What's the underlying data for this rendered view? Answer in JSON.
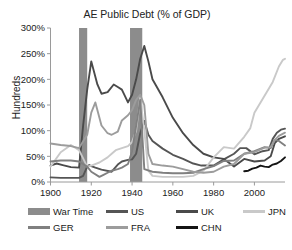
{
  "chart_data": {
    "type": "line",
    "title": "AE Public Debt (% of GDP)",
    "xlabel": "",
    "ylabel": "Hundreds",
    "xlim": [
      1900,
      2015
    ],
    "ylim": [
      0,
      300
    ],
    "ytick_labels": [
      "0%",
      "50%",
      "100%",
      "150%",
      "200%",
      "250%",
      "300%"
    ],
    "ytick_values": [
      0,
      50,
      100,
      150,
      200,
      250,
      300
    ],
    "xtick_labels": [
      "1900",
      "1920",
      "1940",
      "1960",
      "1980",
      "2000"
    ],
    "xtick_values": [
      1900,
      1920,
      1940,
      1960,
      1980,
      2000
    ],
    "grid": false,
    "legend_position": "bottom",
    "shaded_bands": [
      {
        "name": "War Time",
        "start": 1914,
        "end": 1918,
        "color": "#8c8c8c"
      },
      {
        "name": "War Time",
        "start": 1939,
        "end": 1945,
        "color": "#8c8c8c"
      }
    ],
    "series": [
      {
        "name": "US",
        "color": "#555555",
        "x": [
          1900,
          1905,
          1910,
          1914,
          1916,
          1918,
          1919,
          1920,
          1922,
          1925,
          1930,
          1933,
          1935,
          1938,
          1940,
          1942,
          1944,
          1946,
          1948,
          1950,
          1955,
          1960,
          1965,
          1970,
          1974,
          1980,
          1985,
          1990,
          1993,
          1996,
          2000,
          2004,
          2007,
          2009,
          2011,
          2013,
          2015
        ],
        "y": [
          9,
          8,
          8,
          8,
          12,
          30,
          33,
          31,
          28,
          24,
          20,
          34,
          40,
          43,
          44,
          55,
          95,
          119,
          92,
          80,
          65,
          53,
          45,
          36,
          32,
          32,
          44,
          55,
          66,
          66,
          54,
          60,
          62,
          84,
          96,
          102,
          104
        ]
      },
      {
        "name": "UK",
        "color": "#4a4a4a",
        "x": [
          1900,
          1903,
          1906,
          1910,
          1914,
          1916,
          1918,
          1920,
          1923,
          1925,
          1928,
          1931,
          1933,
          1935,
          1938,
          1940,
          1942,
          1944,
          1946,
          1948,
          1950,
          1955,
          1960,
          1965,
          1970,
          1975,
          1980,
          1985,
          1990,
          1995,
          2000,
          2005,
          2008,
          2010,
          2012,
          2015
        ],
        "y": [
          32,
          36,
          33,
          29,
          28,
          110,
          180,
          235,
          190,
          172,
          175,
          190,
          185,
          180,
          155,
          170,
          200,
          240,
          265,
          235,
          200,
          165,
          125,
          95,
          72,
          55,
          48,
          45,
          30,
          45,
          40,
          42,
          50,
          76,
          84,
          89
        ]
      },
      {
        "name": "JPN",
        "color": "#c9c9c9",
        "x": [
          1900,
          1905,
          1910,
          1914,
          1918,
          1920,
          1924,
          1928,
          1930,
          1932,
          1935,
          1938,
          1940,
          1942,
          1944,
          1946,
          1948,
          1950,
          1955,
          1960,
          1965,
          1970,
          1975,
          1980,
          1985,
          1990,
          1995,
          1998,
          2000,
          2003,
          2006,
          2009,
          2012,
          2014,
          2015
        ],
        "y": [
          30,
          58,
          72,
          62,
          30,
          32,
          38,
          48,
          55,
          62,
          66,
          70,
          78,
          100,
          165,
          100,
          22,
          12,
          10,
          10,
          10,
          12,
          22,
          48,
          68,
          65,
          88,
          105,
          135,
          155,
          175,
          195,
          225,
          238,
          240
        ]
      },
      {
        "name": "GER",
        "color": "#808080",
        "x": [
          1900,
          1905,
          1910,
          1914,
          1918,
          1920,
          1924,
          1926,
          1928,
          1930,
          1933,
          1935,
          1938,
          1940,
          1942,
          1944,
          1946,
          1950,
          1955,
          1960,
          1965,
          1970,
          1975,
          1980,
          1985,
          1990,
          1995,
          2000,
          2005,
          2008,
          2010,
          2012,
          2015
        ],
        "y": [
          40,
          42,
          42,
          40,
          30,
          20,
          10,
          14,
          18,
          22,
          25,
          28,
          35,
          60,
          110,
          160,
          25,
          20,
          18,
          17,
          17,
          18,
          25,
          31,
          41,
          42,
          55,
          60,
          68,
          66,
          82,
          80,
          71
        ]
      },
      {
        "name": "FRA",
        "color": "#9c9c9c",
        "x": [
          1900,
          1905,
          1910,
          1914,
          1918,
          1920,
          1922,
          1925,
          1928,
          1930,
          1933,
          1935,
          1938,
          1940,
          1942,
          1944,
          1946,
          1948,
          1950,
          1955,
          1960,
          1965,
          1970,
          1975,
          1980,
          1985,
          1990,
          1995,
          2000,
          2005,
          2008,
          2010,
          2012,
          2015
        ],
        "y": [
          75,
          72,
          70,
          66,
          92,
          135,
          155,
          110,
          95,
          92,
          98,
          120,
          130,
          140,
          160,
          170,
          150,
          55,
          35,
          32,
          30,
          25,
          20,
          18,
          20,
          30,
          35,
          55,
          58,
          67,
          68,
          82,
          90,
          96
        ]
      },
      {
        "name": "CHN",
        "color": "#141414",
        "x": [
          1995,
          1997,
          1999,
          2001,
          2003,
          2005,
          2007,
          2009,
          2011,
          2013,
          2015
        ],
        "y": [
          21,
          22,
          26,
          28,
          32,
          30,
          29,
          34,
          36,
          41,
          48
        ]
      }
    ]
  },
  "legend": {
    "items": [
      {
        "label": "War Time",
        "color": "#8c8c8c",
        "marker": "band"
      },
      {
        "label": "US",
        "color": "#555555",
        "marker": "line"
      },
      {
        "label": "UK",
        "color": "#4a4a4a",
        "marker": "line"
      },
      {
        "label": "JPN",
        "color": "#c9c9c9",
        "marker": "line"
      },
      {
        "label": "GER",
        "color": "#808080",
        "marker": "line"
      },
      {
        "label": "FRA",
        "color": "#9c9c9c",
        "marker": "line"
      },
      {
        "label": "CHN",
        "color": "#141414",
        "marker": "line"
      }
    ]
  }
}
